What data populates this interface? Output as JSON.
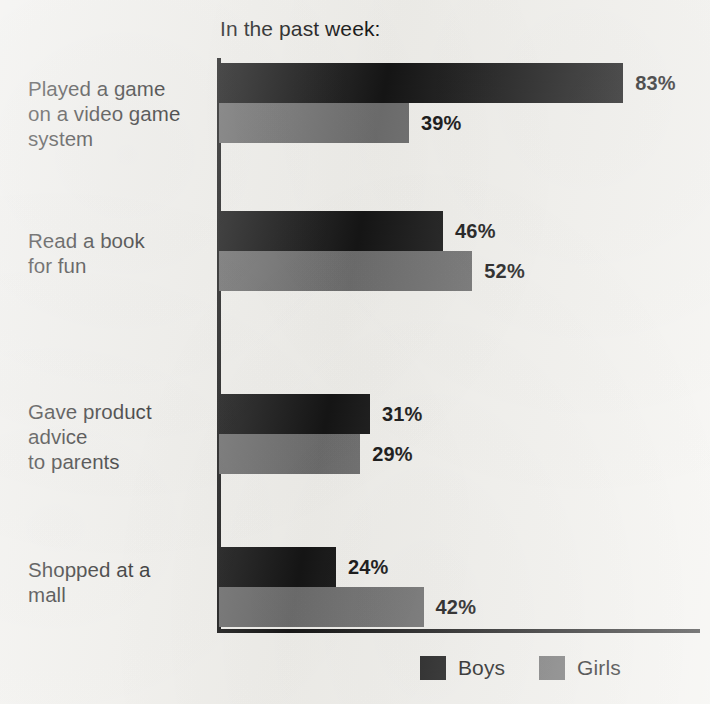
{
  "chart_data": {
    "type": "bar",
    "orientation": "horizontal",
    "title": "In the past week:",
    "xlabel": "",
    "ylabel": "",
    "xlim": [
      0,
      100
    ],
    "grid": false,
    "legend_position": "bottom-right",
    "categories": [
      "Played a game\non a video game\nsystem",
      "Read a book\nfor fun",
      "Gave product\nadvice\nto parents",
      "Shopped at a\nmall"
    ],
    "series": [
      {
        "name": "Boys",
        "color": "#151515",
        "values": [
          83,
          46,
          31,
          24
        ],
        "value_labels": [
          "83%",
          "46%",
          "31%",
          "24%"
        ]
      },
      {
        "name": "Girls",
        "color": "#6e6e6e",
        "values": [
          39,
          52,
          29,
          42
        ],
        "value_labels": [
          "39%",
          "52%",
          "29%",
          "42%"
        ]
      }
    ]
  },
  "legend": {
    "items": [
      {
        "label": "Boys",
        "color": "#151515"
      },
      {
        "label": "Girls",
        "color": "#6e6e6e"
      }
    ]
  },
  "axes": {
    "line_color": "#171717"
  }
}
